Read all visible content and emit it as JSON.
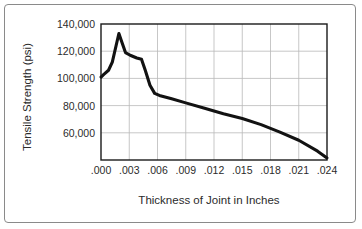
{
  "chart_data": {
    "type": "line",
    "title": "",
    "xlabel": "Thickness of Joint in Inches",
    "ylabel": "Tensile Strength (psi)",
    "xlim": [
      0.0,
      0.024
    ],
    "ylim": [
      40000,
      140000
    ],
    "grid": true,
    "legend": "none",
    "xticks": [
      0.0,
      0.003,
      0.006,
      0.009,
      0.012,
      0.015,
      0.018,
      0.021,
      0.024
    ],
    "xtick_labels": [
      ".000",
      ".003",
      ".006",
      ".009",
      ".012",
      ".015",
      ".018",
      ".021",
      ".024"
    ],
    "yticks": [
      60000,
      80000,
      100000,
      120000,
      140000
    ],
    "ytick_labels": [
      "60,000",
      "80,000",
      "100,000",
      "120,000",
      "140,000"
    ],
    "series": [
      {
        "name": "Tensile Strength",
        "color": "#121212",
        "x": [
          0.0,
          0.0003,
          0.0008,
          0.0012,
          0.0016,
          0.0019,
          0.0022,
          0.0026,
          0.0031,
          0.0038,
          0.0043,
          0.0047,
          0.0052,
          0.0057,
          0.0062,
          0.0075,
          0.009,
          0.011,
          0.013,
          0.015,
          0.017,
          0.019,
          0.021,
          0.023,
          0.024
        ],
        "y": [
          101000,
          103000,
          106000,
          112000,
          124000,
          133000,
          127000,
          119000,
          117000,
          115000,
          114000,
          106000,
          95000,
          89000,
          87500,
          85000,
          82000,
          78000,
          74000,
          70500,
          66000,
          60500,
          54500,
          46500,
          41500
        ]
      }
    ]
  },
  "figure": {
    "frame_color": "#8a8a8a",
    "axis_color": "#1a1a1a",
    "grid_color": "#b9b9b9"
  }
}
